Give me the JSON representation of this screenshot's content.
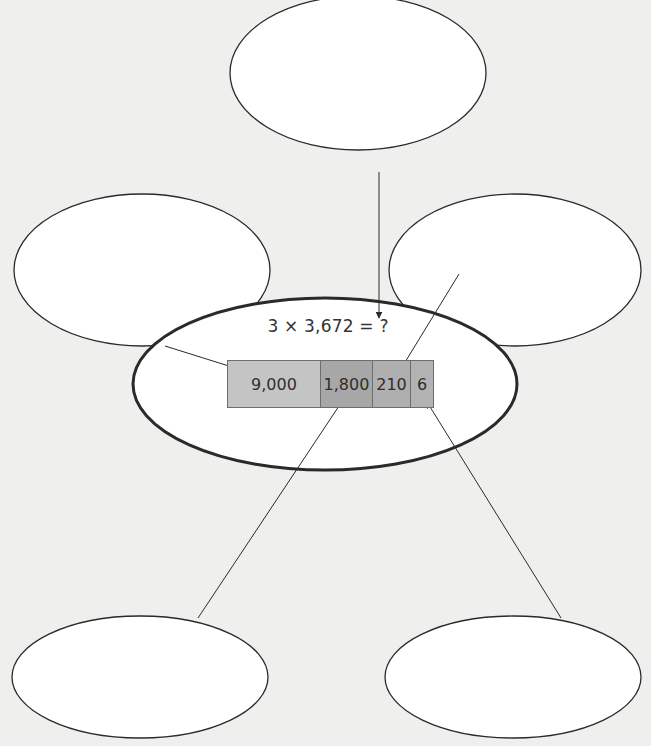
{
  "diagram": {
    "equation": "3 × 3,672 = ?",
    "partial_products": [
      {
        "label": "9,000",
        "color": "#c4c4c4"
      },
      {
        "label": "1,800",
        "color": "#a7a7a7"
      },
      {
        "label": "210",
        "color": "#afafaf"
      },
      {
        "label": "6",
        "color": "#b3b3b3"
      }
    ],
    "empty_bubbles": [
      {
        "position": "top",
        "text": ""
      },
      {
        "position": "upper-left",
        "text": ""
      },
      {
        "position": "upper-right",
        "text": ""
      },
      {
        "position": "lower-left",
        "text": ""
      },
      {
        "position": "lower-right",
        "text": ""
      }
    ],
    "colors": {
      "background": "#efefee",
      "stroke": "#2a2a2a"
    }
  }
}
